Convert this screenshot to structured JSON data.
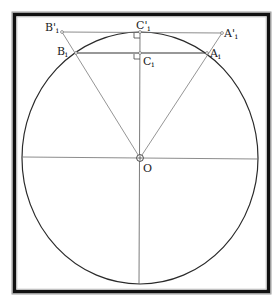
{
  "diagram": {
    "title": "",
    "colors": {
      "frame": "#111111",
      "frame_outline": "#9a9a9a",
      "circle": "#2a2a2a",
      "construction_line": "#6e6e6e",
      "text": "#222222"
    },
    "points": {
      "O": {
        "label": "O",
        "x": 140,
        "y": 158
      },
      "C_prime": {
        "label": "C'",
        "sub": "i",
        "x": 140,
        "y": 32
      },
      "C": {
        "label": "C",
        "sub": "i",
        "x": 140,
        "y": 53
      },
      "A_prime": {
        "label": "A'",
        "sub": "i",
        "x": 222,
        "y": 32
      },
      "B_prime": {
        "label": "B'",
        "sub": "i",
        "x": 62,
        "y": 32
      },
      "A": {
        "label": "A",
        "sub": "i",
        "x": 207,
        "y": 53
      },
      "B": {
        "label": "B",
        "sub": "i",
        "x": 76,
        "y": 53
      }
    },
    "labels": {
      "O": "O",
      "C_prime_main": "C'",
      "C_prime_sub": "i",
      "C_main": "C",
      "C_sub": "i",
      "A_prime_main": "A'",
      "A_prime_sub": "i",
      "B_prime_main": "B'",
      "B_prime_sub": "i",
      "A_main": "A",
      "A_sub": "i",
      "B_main": "B",
      "B_sub": "i"
    },
    "circle": {
      "cx": 140,
      "cy": 158,
      "rx": 118,
      "ry": 126
    },
    "segments": [
      {
        "name": "tangent-line",
        "from": "B_prime",
        "to": "A_prime"
      },
      {
        "name": "chord",
        "from": "B",
        "to": "A"
      },
      {
        "name": "ray-o-a-prime",
        "from": "O",
        "to": "A_prime"
      },
      {
        "name": "ray-o-b-prime",
        "from": "O",
        "to": "B_prime"
      },
      {
        "name": "vertical-axis",
        "from": "C_prime",
        "to": "bottom"
      },
      {
        "name": "horizontal-axis",
        "from": "left",
        "to": "right"
      }
    ],
    "right_angle_marks": [
      "C_prime",
      "C"
    ]
  }
}
